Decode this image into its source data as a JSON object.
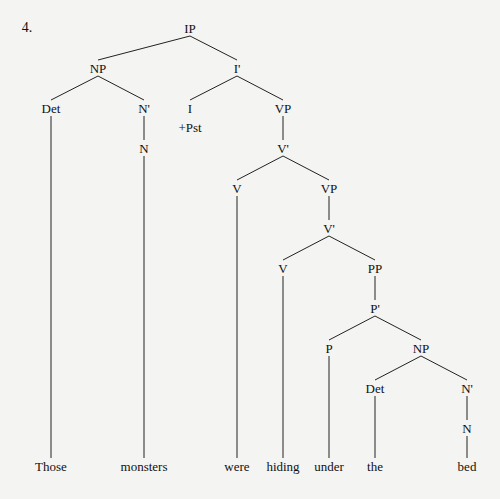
{
  "item_number": "4.",
  "nodes": [
    {
      "id": "IP",
      "label": "IP",
      "x": 190,
      "y": 28
    },
    {
      "id": "NP1",
      "label": "NP",
      "x": 98,
      "y": 68
    },
    {
      "id": "Ibar",
      "label": "I'",
      "x": 237,
      "y": 68
    },
    {
      "id": "Det1",
      "label": "Det",
      "x": 51,
      "y": 108
    },
    {
      "id": "Nbar1",
      "label": "N'",
      "x": 144,
      "y": 108
    },
    {
      "id": "N1",
      "label": "N",
      "x": 144,
      "y": 148
    },
    {
      "id": "I",
      "label": "I",
      "x": 190,
      "y": 108
    },
    {
      "id": "Pst",
      "label": "+Pst",
      "x": 190,
      "y": 127
    },
    {
      "id": "VP1",
      "label": "VP",
      "x": 283,
      "y": 108
    },
    {
      "id": "Vbar1",
      "label": "V'",
      "x": 283,
      "y": 148
    },
    {
      "id": "V1",
      "label": "V",
      "x": 237,
      "y": 188
    },
    {
      "id": "VP2",
      "label": "VP",
      "x": 329,
      "y": 188
    },
    {
      "id": "Vbar2",
      "label": "V'",
      "x": 329,
      "y": 228
    },
    {
      "id": "V2",
      "label": "V",
      "x": 283,
      "y": 268
    },
    {
      "id": "PP",
      "label": "PP",
      "x": 375,
      "y": 268
    },
    {
      "id": "Pbar",
      "label": "P'",
      "x": 375,
      "y": 308
    },
    {
      "id": "P",
      "label": "P",
      "x": 329,
      "y": 348
    },
    {
      "id": "NP2",
      "label": "NP",
      "x": 421,
      "y": 348
    },
    {
      "id": "Det2",
      "label": "Det",
      "x": 375,
      "y": 388
    },
    {
      "id": "Nbar2",
      "label": "N'",
      "x": 467,
      "y": 388
    },
    {
      "id": "N2",
      "label": "N",
      "x": 467,
      "y": 428
    }
  ],
  "leaves": [
    {
      "id": "w1",
      "label": "Those",
      "x": 51,
      "y": 466
    },
    {
      "id": "w2",
      "label": "monsters",
      "x": 144,
      "y": 466
    },
    {
      "id": "w3",
      "label": "were",
      "x": 237,
      "y": 466
    },
    {
      "id": "w4",
      "label": "hiding",
      "x": 283,
      "y": 466
    },
    {
      "id": "w5",
      "label": "under",
      "x": 329,
      "y": 466
    },
    {
      "id": "w6",
      "label": "the",
      "x": 375,
      "y": 466
    },
    {
      "id": "w7",
      "label": "bed",
      "x": 467,
      "y": 466
    }
  ],
  "edges": [
    [
      "IP",
      "NP1"
    ],
    [
      "IP",
      "Ibar"
    ],
    [
      "NP1",
      "Det1"
    ],
    [
      "NP1",
      "Nbar1"
    ],
    [
      "Nbar1",
      "N1"
    ],
    [
      "Ibar",
      "I"
    ],
    [
      "Ibar",
      "VP1"
    ],
    [
      "VP1",
      "Vbar1"
    ],
    [
      "Vbar1",
      "V1"
    ],
    [
      "Vbar1",
      "VP2"
    ],
    [
      "VP2",
      "Vbar2"
    ],
    [
      "Vbar2",
      "V2"
    ],
    [
      "Vbar2",
      "PP"
    ],
    [
      "PP",
      "Pbar"
    ],
    [
      "Pbar",
      "P"
    ],
    [
      "Pbar",
      "NP2"
    ],
    [
      "NP2",
      "Det2"
    ],
    [
      "NP2",
      "Nbar2"
    ],
    [
      "Nbar2",
      "N2"
    ],
    [
      "Det1",
      "w1"
    ],
    [
      "N1",
      "w2"
    ],
    [
      "V1",
      "w3"
    ],
    [
      "V2",
      "w4"
    ],
    [
      "P",
      "w5"
    ],
    [
      "Det2",
      "w6"
    ],
    [
      "N2",
      "w7"
    ]
  ]
}
